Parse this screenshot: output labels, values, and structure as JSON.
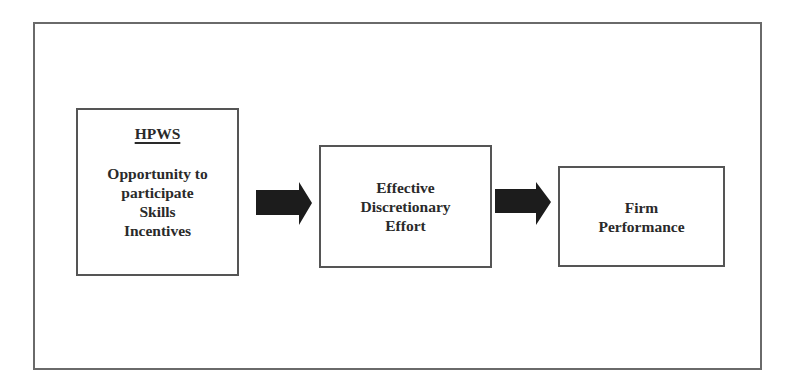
{
  "diagram": {
    "type": "flowchart",
    "nodes": [
      {
        "id": "hpws",
        "heading": "HPWS",
        "lines": [
          "Opportunity to",
          "participate",
          "Skills",
          "Incentives"
        ]
      },
      {
        "id": "effort",
        "lines": [
          "Effective",
          "Discretionary",
          "Effort"
        ]
      },
      {
        "id": "performance",
        "lines": [
          "Firm",
          "Performance"
        ]
      }
    ],
    "edges": [
      {
        "from": "hpws",
        "to": "effort",
        "style": "block-arrow"
      },
      {
        "from": "effort",
        "to": "performance",
        "style": "block-arrow"
      }
    ],
    "colors": {
      "arrow_fill": "#1c1c1c",
      "border": "#555555",
      "text": "#2a2a2a"
    }
  }
}
